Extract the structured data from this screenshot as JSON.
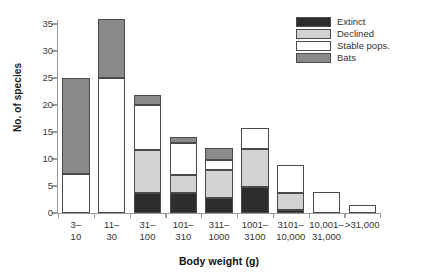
{
  "chart_data": {
    "type": "bar",
    "subtype": "stacked-bar",
    "title": "",
    "xlabel": "Body weight (g)",
    "ylabel": "No. of species",
    "categories": [
      "3–\n10",
      "11–\n30",
      "31–\n100",
      "101–\n310",
      "311–\n1000",
      "1001–\n3100",
      "3101–\n10,000",
      "10,001–\n31,000",
      ">31,000"
    ],
    "categories_flat": [
      "3–10",
      "11–30",
      "31–100",
      "101–310",
      "311–1000",
      "1001–3100",
      "3101–10,000",
      "10,001–31,000",
      ">31,000"
    ],
    "series": [
      {
        "name": "Extinct",
        "color": "#2d2d2d",
        "values": [
          0,
          0,
          3.7,
          3.7,
          2.7,
          4.9,
          0.6,
          0,
          0
        ]
      },
      {
        "name": "Declined",
        "color": "#d2d2d2",
        "values": [
          0,
          0,
          8.0,
          3.3,
          5.3,
          6.9,
          3.1,
          0,
          0
        ]
      },
      {
        "name": "Stable pops.",
        "color": "#ffffff",
        "values": [
          7.2,
          25.0,
          8.3,
          6.0,
          1.8,
          4.0,
          5.1,
          3.8,
          1.5
        ]
      },
      {
        "name": "Bats",
        "color": "#8a8a8a",
        "values": [
          17.8,
          11.0,
          1.8,
          1.0,
          2.2,
          0,
          0,
          0,
          0
        ]
      }
    ],
    "totals": [
      25,
      36,
      21.8,
      14,
      12,
      15.8,
      8.8,
      3.8,
      1.5
    ],
    "ylim": [
      0,
      37
    ],
    "yticks": [
      0,
      5,
      10,
      15,
      20,
      25,
      30,
      35
    ],
    "ytick_labels": [
      "0",
      "5",
      "10",
      "15",
      "20",
      "25",
      "30",
      "35"
    ],
    "grid": false,
    "legend_position": "top-right",
    "legend_entries": [
      "Extinct",
      "Declined",
      "Stable pops.",
      "Bats"
    ]
  }
}
